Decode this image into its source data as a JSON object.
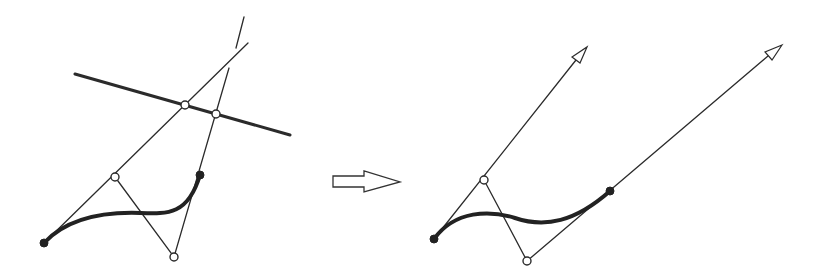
{
  "diagram": {
    "colors": {
      "stroke": "#2b2b2b",
      "curve": "#222222",
      "background": "#ffffff"
    },
    "left_figure": {
      "cutting_line": {
        "from": [
          75,
          74
        ],
        "to": [
          290,
          135
        ]
      },
      "curve": {
        "start": [
          44,
          243
        ],
        "c1": [
          115,
          177
        ],
        "c2": [
          174,
          257
        ],
        "end": [
          200,
          175
        ]
      },
      "control_points_open": [
        [
          115,
          177
        ],
        [
          174,
          257
        ]
      ],
      "endpoints_filled": [
        [
          44,
          243
        ],
        [
          200,
          175
        ]
      ],
      "intersections_open": [
        [
          185,
          105
        ],
        [
          216,
          114
        ]
      ],
      "line_a": {
        "from": [
          44,
          243
        ],
        "to": [
          248,
          43
        ]
      },
      "line_b_lower": {
        "from": [
          174,
          257
        ],
        "to": [
          229,
          68
        ]
      },
      "line_b_upper": {
        "from": [
          236,
          48
        ],
        "to": [
          244,
          17
        ]
      },
      "segment_c1_c2": {
        "from": [
          115,
          177
        ],
        "to": [
          174,
          257
        ]
      }
    },
    "transform_arrow": {
      "label": "transforms to",
      "shaft": {
        "x1": 333,
        "x2": 364,
        "y1": 176,
        "y2": 187
      },
      "head": {
        "base_x": 364,
        "top_y": 171,
        "bottom_y": 192,
        "tip": [
          400,
          182
        ]
      }
    },
    "right_figure": {
      "curve": {
        "start": [
          434,
          239
        ],
        "c1": [
          484,
          180
        ],
        "c2": [
          527,
          261
        ],
        "end": [
          610,
          191
        ]
      },
      "control_points_open": [
        [
          484,
          180
        ],
        [
          527,
          261
        ]
      ],
      "endpoints_filled": [
        [
          434,
          239
        ],
        [
          610,
          191
        ]
      ],
      "ray_a": {
        "from": [
          434,
          239
        ],
        "tip": [
          587,
          47
        ]
      },
      "ray_b": {
        "from": [
          527,
          261
        ],
        "tip": [
          782,
          45
        ]
      },
      "segment_c1_c2": {
        "from": [
          484,
          180
        ],
        "to": [
          527,
          261
        ]
      }
    }
  }
}
